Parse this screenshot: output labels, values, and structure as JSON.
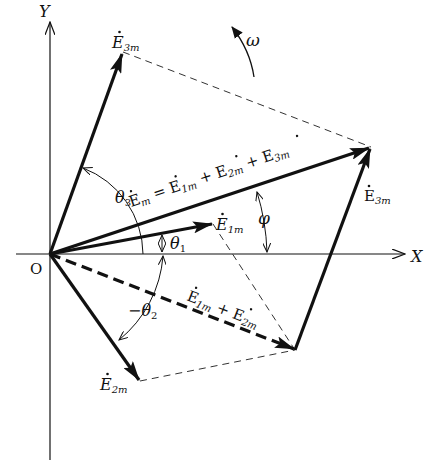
{
  "diagram": {
    "axes": {
      "x_label": "X",
      "y_label": "Y",
      "origin_label": "O"
    },
    "rotation": {
      "label": "ω",
      "direction": "counter-clockwise"
    },
    "phasors": [
      {
        "id": "E1m",
        "label_main": "E",
        "label_sub": "1m",
        "style": "solid",
        "angle_label": "θ",
        "angle_sub": "1"
      },
      {
        "id": "E2m",
        "label_main": "E",
        "label_sub": "2m",
        "style": "solid",
        "angle_label": "−θ",
        "angle_sub": "2"
      },
      {
        "id": "E3m",
        "label_main": "E",
        "label_sub": "3m",
        "style": "solid",
        "angle_label": "θ",
        "angle_sub": "3"
      },
      {
        "id": "E1m_plus_E2m",
        "label": "Ė1m + Ė2m",
        "style": "dashed"
      },
      {
        "id": "Em",
        "label": "Ėm = Ė1m + Ė2m + Ė3m",
        "style": "solid",
        "angle_label": "φ"
      }
    ],
    "labels": {
      "e3m_top": {
        "main": "E",
        "sub": "3m"
      },
      "e3m_right": {
        "main": "E",
        "sub": "3m"
      },
      "e1m": {
        "main": "E",
        "sub": "1m"
      },
      "e2m": {
        "main": "E",
        "sub": "2m"
      },
      "em_eq": {
        "e": "E",
        "m": "m",
        "eq": " = ",
        "e1": "E",
        "s1": "1m",
        "plus1": " + ",
        "e2": "E",
        "s2": "2m",
        "plus2": " + ",
        "e3": "E",
        "s3": "3m"
      },
      "e12": {
        "e1": "E",
        "s1": "1m",
        "plus": " + ",
        "e2": "E",
        "s2": "2m"
      },
      "theta1": {
        "main": "θ",
        "sub": "1"
      },
      "theta2": {
        "main": "−θ",
        "sub": "2"
      },
      "theta3": {
        "main": "θ",
        "sub": "3"
      },
      "phi": "φ",
      "omega": "ω"
    }
  }
}
